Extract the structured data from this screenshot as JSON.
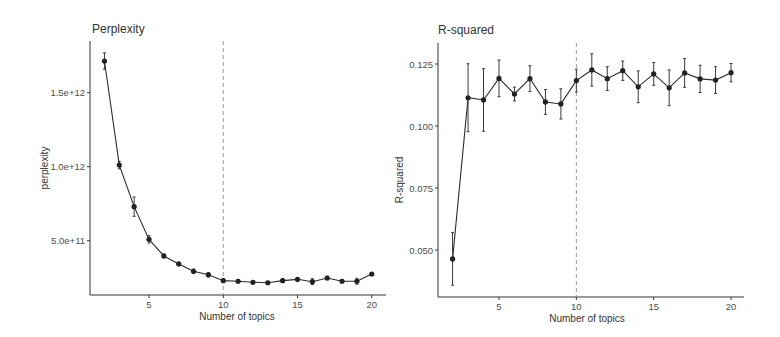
{
  "chart_data": [
    {
      "type": "line",
      "title": "Perplexity",
      "xlabel": "Number of topics",
      "ylabel": "perplexity",
      "x": [
        2,
        3,
        4,
        5,
        6,
        7,
        8,
        9,
        10,
        11,
        12,
        13,
        14,
        15,
        16,
        17,
        18,
        19,
        20
      ],
      "series": [
        {
          "name": "perplexity",
          "values": [
            1714000000000.0,
            1011000000000.0,
            730000000000.0,
            509000000000.0,
            397000000000.0,
            343000000000.0,
            293000000000.0,
            270000000000.0,
            230000000000.0,
            226000000000.0,
            219000000000.0,
            216000000000.0,
            230000000000.0,
            239000000000.0,
            223000000000.0,
            248000000000.0,
            226000000000.0,
            226000000000.0,
            275000000000.0
          ],
          "error": [
            55000000000.0,
            25000000000.0,
            65000000000.0,
            25000000000.0,
            12000000000.0,
            10000000000.0,
            15000000000.0,
            15000000000.0,
            12000000000.0,
            10000000000.0,
            8000000000.0,
            8000000000.0,
            12000000000.0,
            12000000000.0,
            20000000000.0,
            12000000000.0,
            8000000000.0,
            20000000000.0,
            10000000000.0
          ]
        }
      ],
      "yticks": [
        500000000000.0,
        1000000000000.0,
        1500000000000.0
      ],
      "ytick_labels": [
        "5.0e+11",
        "1.0e+12",
        "1.5e+12"
      ],
      "xticks": [
        5,
        10,
        15,
        20
      ],
      "xtick_labels": [
        "5",
        "10",
        "15",
        "20"
      ],
      "vline_x": 10,
      "grid": false,
      "legend": "none"
    },
    {
      "type": "line",
      "title": "R-squared",
      "xlabel": "Number of topics",
      "ylabel": "R-squared",
      "x": [
        2,
        3,
        4,
        5,
        6,
        7,
        8,
        9,
        10,
        11,
        12,
        13,
        14,
        15,
        16,
        17,
        18,
        19,
        20
      ],
      "series": [
        {
          "name": "R-squared",
          "values": [
            0.0464,
            0.1114,
            0.1105,
            0.1192,
            0.1129,
            0.1191,
            0.1097,
            0.1089,
            0.1183,
            0.1226,
            0.1191,
            0.1223,
            0.1158,
            0.121,
            0.1154,
            0.1214,
            0.119,
            0.1185,
            0.1215
          ],
          "error": [
            0.0106,
            0.0137,
            0.0126,
            0.0074,
            0.0028,
            0.0052,
            0.005,
            0.0061,
            0.0046,
            0.0065,
            0.0048,
            0.0039,
            0.0064,
            0.0046,
            0.0072,
            0.0058,
            0.0055,
            0.0054,
            0.0037
          ]
        }
      ],
      "yticks": [
        0.05,
        0.075,
        0.1,
        0.125
      ],
      "ytick_labels": [
        "0.050",
        "0.075",
        "0.100",
        "0.125"
      ],
      "xticks": [
        5,
        10,
        15,
        20
      ],
      "xtick_labels": [
        "5",
        "10",
        "15",
        "20"
      ],
      "vline_x": 10,
      "grid": false,
      "legend": "none"
    }
  ],
  "panels": {
    "left": {
      "title": "Perplexity",
      "ylabel": "perplexity",
      "xlabel": "Number of topics"
    },
    "right": {
      "title": "R-squared",
      "ylabel": "R-squared",
      "xlabel": "Number of topics"
    }
  }
}
